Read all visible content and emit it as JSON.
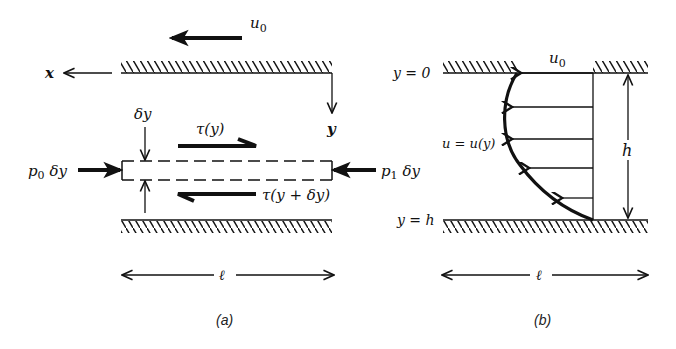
{
  "figure": {
    "panel_a": {
      "caption": "(a)",
      "x_axis_label": "x",
      "y_axis_label": "y",
      "wall_velocity_label": "u",
      "wall_velocity_sub": "0",
      "delta_y_label": "δy",
      "shear_top_label": "τ(y)",
      "shear_bottom_label": "τ(y + δy)",
      "pressure_left_label": "p",
      "pressure_left_sub": "0",
      "pressure_left_suffix": " δy",
      "pressure_right_label": "p",
      "pressure_right_sub": "1",
      "pressure_right_suffix": " δy",
      "length_label": "ℓ"
    },
    "panel_b": {
      "caption": "(b)",
      "top_wall_label": "y = 0",
      "bottom_wall_label": "y = h",
      "wall_velocity_label": "u",
      "wall_velocity_sub": "0",
      "profile_label": "u = u(y)",
      "height_label": "h",
      "length_label": "ℓ"
    },
    "colors": {
      "ink": "#111111",
      "background": "#ffffff"
    }
  }
}
